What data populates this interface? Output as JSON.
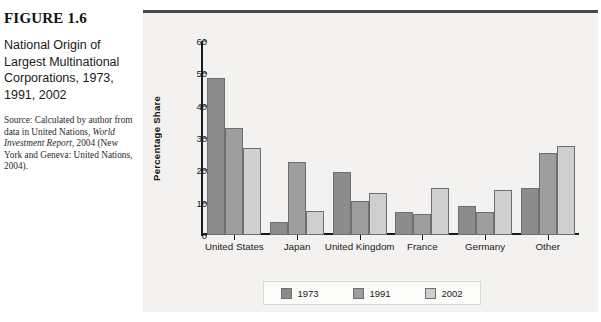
{
  "caption": {
    "figure_number": "FIGURE 1.6",
    "title": "National Origin of Largest Multinational Corporations, 1973, 1991, 2002",
    "source_line1": "Source: Calculated by author",
    "source_line2": "from data in United Nations,",
    "source_italic": "World Investment Report",
    "source_line3": ", 2004",
    "source_line4": "(New York and Geneva: United",
    "source_line5": "Nations, 2004)."
  },
  "chart_data": {
    "type": "bar",
    "title": "",
    "xlabel": "",
    "ylabel": "Percentage Share",
    "ylim": [
      0,
      60
    ],
    "yticks": [
      0,
      10,
      20,
      30,
      40,
      50,
      60
    ],
    "grid": false,
    "legend_position": "bottom",
    "categories": [
      "United States",
      "Japan",
      "United Kingdom",
      "France",
      "Germany",
      "Other"
    ],
    "series": [
      {
        "name": "1973",
        "color": "#8c8c8c",
        "values": [
          48.5,
          4,
          19.5,
          7,
          9,
          14.5
        ]
      },
      {
        "name": "1991",
        "color": "#9e9e9e",
        "values": [
          33,
          22.5,
          10.5,
          6.5,
          7,
          25.5
        ]
      },
      {
        "name": "2002",
        "color": "#cfcfcf",
        "values": [
          27,
          7.5,
          13,
          14.5,
          14,
          27.5
        ]
      }
    ]
  }
}
